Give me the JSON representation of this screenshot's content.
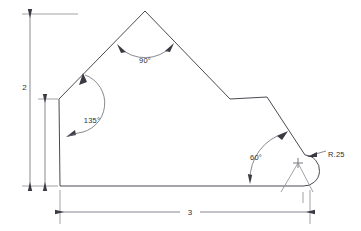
{
  "drawing": {
    "title": "Engineering Part Outline Drawing",
    "canvas": {
      "width": 361,
      "height": 231
    },
    "colors": {
      "background": "#ffffff",
      "outline": "#4a4a52",
      "dimension": "#6b6b73",
      "extension": "#8a8a92",
      "text": "#2e2e34",
      "arrow": "#3a3a42"
    },
    "dimensions": {
      "height_label": "2",
      "width_label": "3",
      "radius_label": "R.25"
    },
    "angles": {
      "apex_label": "90°",
      "left_label": "135°",
      "lower_right_label": "60°"
    },
    "geometry": {
      "vertices": [
        {
          "name": "left-upper",
          "x": 59,
          "y": 99
        },
        {
          "name": "apex",
          "x": 145,
          "y": 11
        },
        {
          "name": "step-upper-left",
          "x": 230,
          "y": 99
        },
        {
          "name": "step-upper-right",
          "x": 267,
          "y": 97
        },
        {
          "name": "fillet-start",
          "x": 305,
          "y": 155
        },
        {
          "name": "fillet-end",
          "x": 303,
          "y": 186
        },
        {
          "name": "bottom-left",
          "x": 60,
          "y": 186
        }
      ],
      "fillet": {
        "center_x": 298,
        "center_y": 163,
        "radius": 13
      }
    }
  }
}
